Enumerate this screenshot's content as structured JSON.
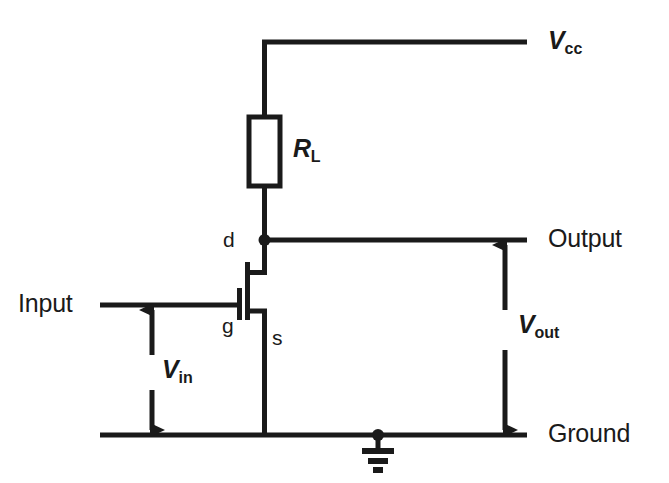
{
  "diagram": {
    "type": "circuit-schematic",
    "background_color": "#ffffff",
    "ink_color": "#1a1a1a"
  },
  "rails": {
    "supply": {
      "label": "V",
      "subscript": "cc",
      "name": "vcc-rail"
    },
    "output": {
      "label": "Output",
      "name": "output-rail"
    },
    "ground": {
      "label": "Ground",
      "name": "ground-rail"
    },
    "input": {
      "label": "Input",
      "name": "input-rail"
    }
  },
  "components": {
    "load_resistor": {
      "label": "R",
      "subscript": "L",
      "name": "load-resistor"
    },
    "transistor": {
      "name": "mosfet",
      "terminals": [
        {
          "id": "d",
          "label": "d",
          "meaning": "drain"
        },
        {
          "id": "g",
          "label": "g",
          "meaning": "gate"
        },
        {
          "id": "s",
          "label": "s",
          "meaning": "source"
        }
      ]
    },
    "ground_symbol": {
      "name": "earth-ground-symbol"
    }
  },
  "measurements": [
    {
      "name": "vin-arrow",
      "label": "V",
      "subscript": "in",
      "between": [
        "input-rail",
        "ground-rail"
      ]
    },
    {
      "name": "vout-arrow",
      "label": "V",
      "subscript": "out",
      "between": [
        "output-rail",
        "ground-rail"
      ]
    }
  ]
}
